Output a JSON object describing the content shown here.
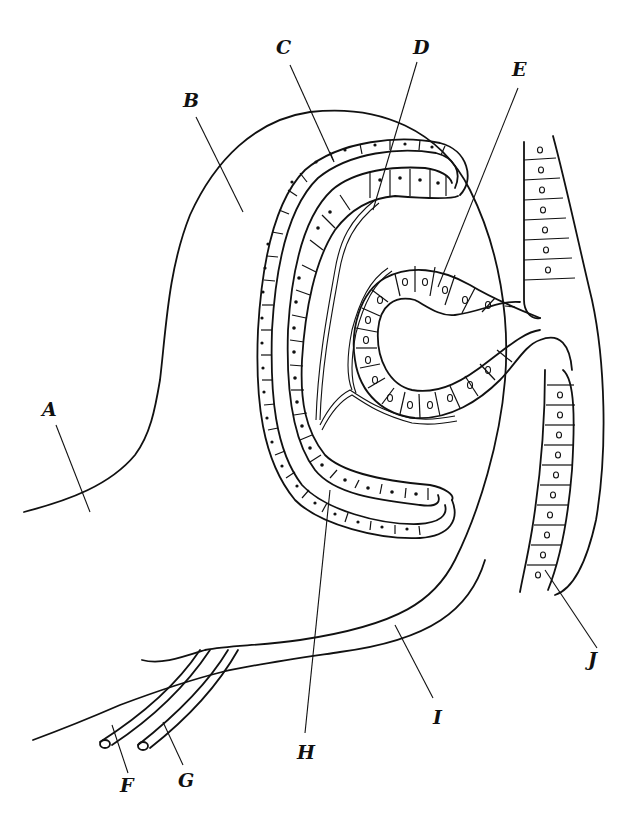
{
  "diagram": {
    "type": "anatomical line drawing (embryonic epithelial structures in cross section)",
    "background": "#ffffff",
    "line_color": "#111111",
    "labels": [
      {
        "id": "A",
        "text": "A",
        "x": 42,
        "y": 400
      },
      {
        "id": "B",
        "text": "B",
        "x": 183,
        "y": 91
      },
      {
        "id": "C",
        "text": "C",
        "x": 276,
        "y": 38
      },
      {
        "id": "D",
        "text": "D",
        "x": 413,
        "y": 38
      },
      {
        "id": "E",
        "text": "E",
        "x": 512,
        "y": 60
      },
      {
        "id": "F",
        "text": "F",
        "x": 120,
        "y": 776
      },
      {
        "id": "G",
        "text": "G",
        "x": 178,
        "y": 771
      },
      {
        "id": "H",
        "text": "H",
        "x": 297,
        "y": 743
      },
      {
        "id": "I",
        "text": "I",
        "x": 433,
        "y": 708
      },
      {
        "id": "J",
        "text": "J",
        "x": 588,
        "y": 650
      }
    ]
  }
}
